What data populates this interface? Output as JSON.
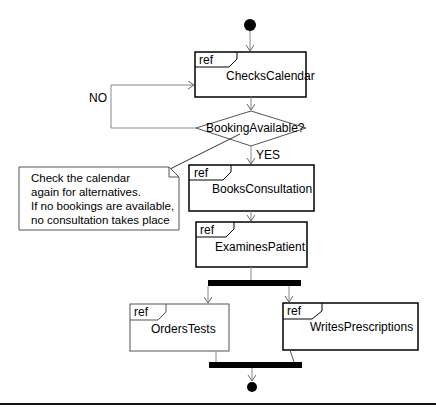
{
  "diagram": {
    "type": "UML activity diagram",
    "start_node": {
      "label": "initial-node"
    },
    "end_node": {
      "label": "final-node"
    },
    "activities": [
      {
        "id": "checks_calendar",
        "tag": "ref",
        "label": "ChecksCalendar"
      },
      {
        "id": "books_consultation",
        "tag": "ref",
        "label": "BooksConsultation"
      },
      {
        "id": "examines_patient",
        "tag": "ref",
        "label": "ExaminesPatient"
      },
      {
        "id": "orders_tests",
        "tag": "ref",
        "label": "OrdersTests"
      },
      {
        "id": "writes_prescriptions",
        "tag": "ref",
        "label": "WritesPrescriptions"
      }
    ],
    "decision": {
      "label": "BookingAvailable?"
    },
    "guards": {
      "no": "NO",
      "yes": "YES"
    },
    "note": {
      "lines": [
        "Check the calendar",
        "again for alternatives.",
        "If no bookings are available,",
        "no consultation takes place"
      ]
    },
    "colors": {
      "stroke": "#000000",
      "edge": "#888888",
      "background": "#ffffff"
    }
  }
}
